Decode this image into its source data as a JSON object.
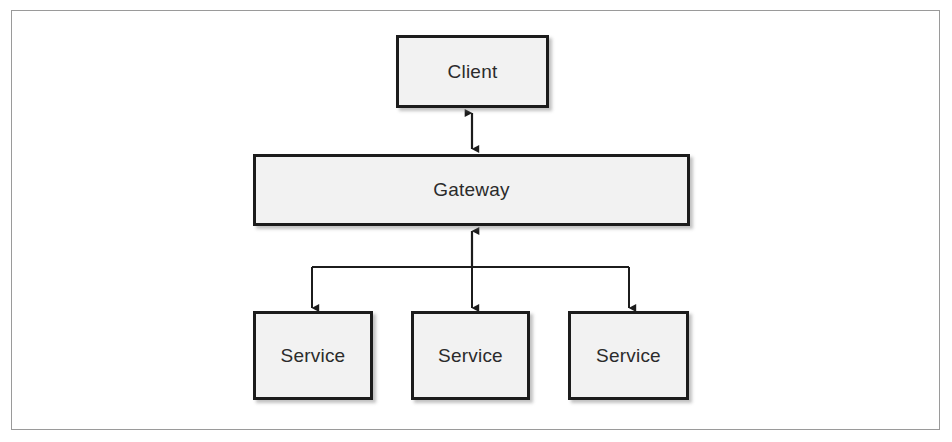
{
  "figure": {
    "type": "block-diagram",
    "background_color": "#ffffff",
    "frame_border_color": "#9a9a9a",
    "node_fill_color": "#f2f2f2",
    "node_border_color": "#1c1c1c",
    "connector_color": "#1c1c1c",
    "label_color": "#2b2b2b"
  },
  "nodes": {
    "client": {
      "label": "Client"
    },
    "gateway": {
      "label": "Gateway"
    },
    "services": [
      {
        "label": "Service"
      },
      {
        "label": "Service"
      },
      {
        "label": "Service"
      }
    ]
  },
  "connectors": [
    {
      "from": "client",
      "to": "gateway",
      "direction": "bidirectional"
    },
    {
      "from": "gateway",
      "to": "service-1",
      "direction": "downward"
    },
    {
      "from": "gateway",
      "to": "service-2",
      "direction": "downward"
    },
    {
      "from": "gateway",
      "to": "service-3",
      "direction": "downward"
    }
  ]
}
